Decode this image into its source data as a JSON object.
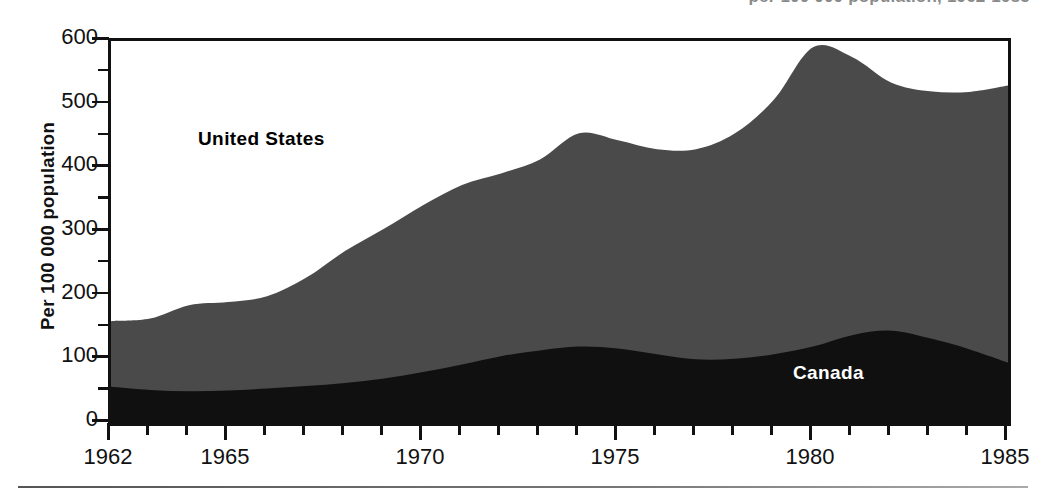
{
  "chart_data": {
    "type": "area",
    "title": "per 100 000 population, 1962-1985",
    "subtitle": "",
    "xlabel": "",
    "ylabel": "Per 100 000 population",
    "stacked": true,
    "grid": false,
    "legend_position": "in-plot",
    "xlim": [
      1962,
      1985
    ],
    "ylim": [
      0,
      600
    ],
    "ytick_major": [
      0,
      100,
      200,
      300,
      400,
      500,
      600
    ],
    "ytick_minor": [
      50,
      150,
      250,
      350,
      450,
      550
    ],
    "xtick_major": [
      1962,
      1965,
      1970,
      1975,
      1980,
      1985
    ],
    "xtick_labels": [
      "1962",
      "1965",
      "1970",
      "1975",
      "1980",
      "1985"
    ],
    "xtick_minor_step": 1,
    "x": [
      1962,
      1963,
      1964,
      1965,
      1966,
      1967,
      1968,
      1969,
      1970,
      1971,
      1972,
      1973,
      1974,
      1975,
      1976,
      1977,
      1978,
      1979,
      1980,
      1981,
      1982,
      1983,
      1984,
      1985
    ],
    "series": [
      {
        "name": "Canada",
        "color": "#101010",
        "label_color": "#ffffff",
        "values": [
          57,
          52,
          50,
          51,
          54,
          58,
          63,
          70,
          80,
          92,
          105,
          114,
          120,
          117,
          108,
          100,
          101,
          108,
          120,
          138,
          145,
          133,
          116,
          95
        ]
      },
      {
        "name": "United States",
        "color": "#4a4a4a",
        "label_color": "#000000",
        "values": [
          103,
          112,
          135,
          139,
          145,
          170,
          207,
          235,
          262,
          282,
          287,
          300,
          335,
          327,
          322,
          330,
          354,
          400,
          470,
          437,
          390,
          388,
          404,
          435
        ]
      }
    ],
    "totals": [
      160,
      164,
      185,
      190,
      199,
      228,
      270,
      305,
      342,
      374,
      392,
      414,
      455,
      444,
      430,
      430,
      455,
      508,
      590,
      575,
      535,
      521,
      520,
      530
    ],
    "annotations": [
      {
        "text": "United States",
        "x": 1967.6,
        "y": 430
      },
      {
        "text": "Canada",
        "x": 1980.0,
        "y": 75
      }
    ]
  },
  "axis": {
    "y_title": "Per 100 000 population",
    "y_labels": [
      "600",
      "500",
      "400",
      "300",
      "200",
      "100",
      "0"
    ],
    "x_labels": [
      "1962",
      "1965",
      "1970",
      "1975",
      "1980",
      "1985"
    ]
  },
  "labels": {
    "united_states": "United States",
    "canada": "Canada"
  },
  "title_fragment": "per 100 000 population, 1962-1985",
  "colors": {
    "canada_fill": "#101010",
    "us_fill": "#4a4a4a",
    "axis": "#111111",
    "background": "#ffffff"
  }
}
